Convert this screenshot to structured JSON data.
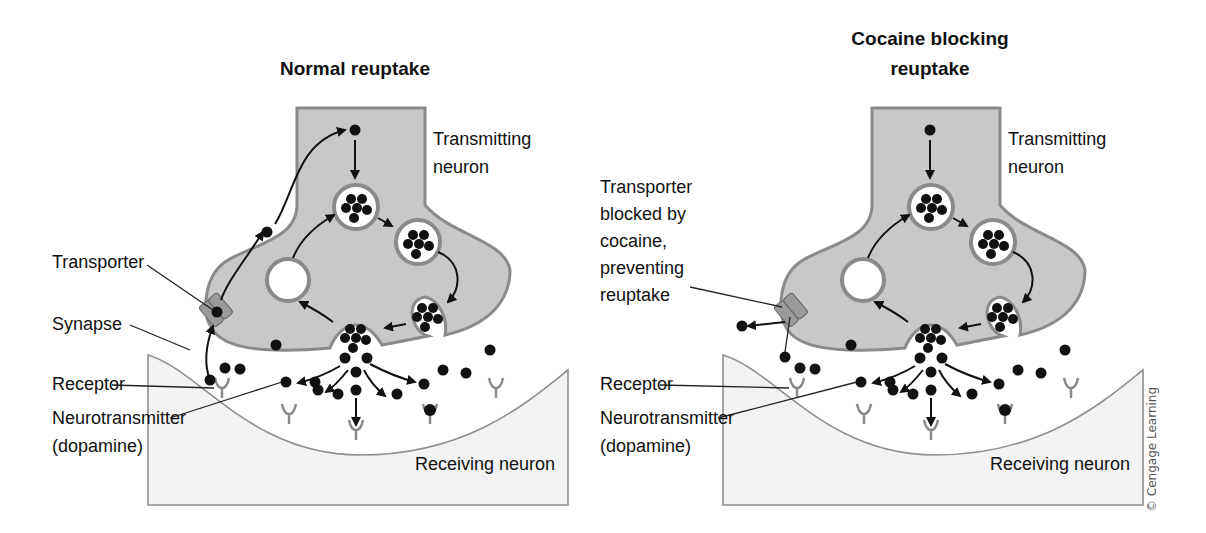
{
  "panels": [
    {
      "id": "normal",
      "title_lines": [
        "Normal reuptake"
      ],
      "labels": {
        "transmitting": [
          "Transmitting",
          "neuron"
        ],
        "receiving": "Receiving neuron",
        "transporter": [
          "Transporter"
        ],
        "synapse": "Synapse",
        "receptor": "Receptor",
        "neurotransmitter": [
          "Neurotransmitter",
          "(dopamine)"
        ]
      },
      "transporter_state": "reuptake-active"
    },
    {
      "id": "cocaine",
      "title_lines": [
        "Cocaine blocking",
        "reuptake"
      ],
      "labels": {
        "transmitting": [
          "Transmitting",
          "neuron"
        ],
        "receiving": "Receiving neuron",
        "transporter": [
          "Transporter",
          "blocked by",
          "cocaine,",
          "preventing",
          "reuptake"
        ],
        "receptor": "Receptor",
        "neurotransmitter": [
          "Neurotransmitter",
          "(dopamine)"
        ]
      },
      "transporter_state": "blocked"
    }
  ],
  "credit": "© Cengage Learning",
  "colors": {
    "neuron_fill": "#c8c8c8",
    "membrane_edge": "#8a8a8a",
    "receiving_fill": "#f3f3f3",
    "molecule": "#111111"
  }
}
